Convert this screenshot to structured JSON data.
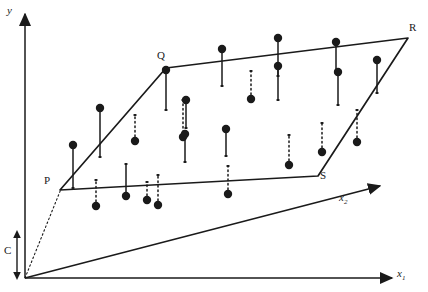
{
  "figure": {
    "background": "#ffffff",
    "ink": "#1a1a1a",
    "width": 428,
    "height": 292
  },
  "axes": {
    "y": {
      "label": "y",
      "label_x": 8,
      "label_y": 10,
      "from": [
        25,
        278
      ],
      "to": [
        25,
        14
      ],
      "arrow": true
    },
    "x1": {
      "label": "x",
      "sub": "1",
      "label_x": 398,
      "label_y": 274,
      "from": [
        25,
        278
      ],
      "to": [
        392,
        278
      ],
      "arrow": true
    },
    "x2": {
      "label": "x",
      "sub": "2",
      "label_x": 340,
      "label_y": 196,
      "from": [
        25,
        278
      ],
      "to": [
        380,
        186
      ],
      "arrow": true
    }
  },
  "intercept": {
    "label": "C",
    "label_x": 5,
    "label_y": 247,
    "arrow_x": 17,
    "arrow_top": 232,
    "arrow_bottom": 278,
    "guide_from": [
      25,
      278
    ],
    "guide_to": [
      60,
      190
    ],
    "style": "dotted double-headed arrow"
  },
  "plane": {
    "name": "regression-plane",
    "vertices": [
      {
        "label": "P",
        "x": 60,
        "y": 190,
        "label_x": 44,
        "label_y": 182
      },
      {
        "label": "Q",
        "x": 166,
        "y": 68,
        "label_x": 158,
        "label_y": 53
      },
      {
        "label": "R",
        "x": 408,
        "y": 38,
        "label_x": 409,
        "label_y": 25
      },
      {
        "label": "S",
        "x": 318,
        "y": 176,
        "label_x": 320,
        "label_y": 176
      }
    ],
    "stroke_width": 1.6
  },
  "chart_data": {
    "type": "scatter",
    "xlabel": "x1",
    "ylabel": "y",
    "zlabel": "x2",
    "grid": false,
    "legend": null,
    "marker_radius": 4.2,
    "points": [
      {
        "id": 1,
        "dot_x": 100,
        "dot_y": 108,
        "foot_x": 100,
        "foot_y": 157,
        "residual": "positive",
        "stem": "solid"
      },
      {
        "id": 2,
        "dot_x": 73,
        "dot_y": 145,
        "foot_x": 73,
        "foot_y": 188,
        "residual": "positive",
        "stem": "solid"
      },
      {
        "id": 3,
        "dot_x": 135,
        "dot_y": 141,
        "foot_x": 135,
        "foot_y": 115,
        "residual": "negative",
        "stem": "dotted"
      },
      {
        "id": 4,
        "dot_x": 126,
        "dot_y": 196,
        "foot_x": 126,
        "foot_y": 164,
        "residual": "positive",
        "stem": "solid"
      },
      {
        "id": 5,
        "dot_x": 166,
        "dot_y": 70,
        "foot_x": 166,
        "foot_y": 110,
        "residual": "positive",
        "stem": "solid"
      },
      {
        "id": 6,
        "dot_x": 158,
        "dot_y": 205,
        "foot_x": 158,
        "foot_y": 175,
        "residual": "negative",
        "stem": "dotted"
      },
      {
        "id": 7,
        "dot_x": 183,
        "dot_y": 137,
        "foot_x": 183,
        "foot_y": 100,
        "residual": "negative",
        "stem": "dotted"
      },
      {
        "id": 8,
        "dot_x": 186,
        "dot_y": 100,
        "foot_x": 186,
        "foot_y": 128,
        "residual": "positive",
        "stem": "solid"
      },
      {
        "id": 9,
        "dot_x": 185,
        "dot_y": 134,
        "foot_x": 185,
        "foot_y": 162,
        "residual": "positive",
        "stem": "solid"
      },
      {
        "id": 10,
        "dot_x": 222,
        "dot_y": 49,
        "foot_x": 222,
        "foot_y": 86,
        "residual": "positive",
        "stem": "solid"
      },
      {
        "id": 11,
        "dot_x": 251,
        "dot_y": 99,
        "foot_x": 251,
        "foot_y": 71,
        "residual": "negative",
        "stem": "dotted"
      },
      {
        "id": 12,
        "dot_x": 226,
        "dot_y": 129,
        "foot_x": 226,
        "foot_y": 156,
        "residual": "positive",
        "stem": "solid"
      },
      {
        "id": 13,
        "dot_x": 228,
        "dot_y": 194,
        "foot_x": 228,
        "foot_y": 166,
        "residual": "negative",
        "stem": "dotted"
      },
      {
        "id": 14,
        "dot_x": 278,
        "dot_y": 66,
        "foot_x": 278,
        "foot_y": 100,
        "residual": "positive",
        "stem": "solid"
      },
      {
        "id": 15,
        "dot_x": 278,
        "dot_y": 38,
        "foot_x": 278,
        "foot_y": 76,
        "residual": "positive",
        "stem": "solid"
      },
      {
        "id": 16,
        "dot_x": 289,
        "dot_y": 165,
        "foot_x": 289,
        "foot_y": 135,
        "residual": "negative",
        "stem": "dotted"
      },
      {
        "id": 17,
        "dot_x": 336,
        "dot_y": 42,
        "foot_x": 336,
        "foot_y": 73,
        "residual": "positive",
        "stem": "solid"
      },
      {
        "id": 18,
        "dot_x": 338,
        "dot_y": 72,
        "foot_x": 338,
        "foot_y": 105,
        "residual": "positive",
        "stem": "solid"
      },
      {
        "id": 19,
        "dot_x": 322,
        "dot_y": 152,
        "foot_x": 322,
        "foot_y": 123,
        "residual": "negative",
        "stem": "dotted"
      },
      {
        "id": 20,
        "dot_x": 377,
        "dot_y": 60,
        "foot_x": 377,
        "foot_y": 93,
        "residual": "positive",
        "stem": "solid"
      },
      {
        "id": 21,
        "dot_x": 357,
        "dot_y": 142,
        "foot_x": 357,
        "foot_y": 110,
        "residual": "negative",
        "stem": "dotted"
      },
      {
        "id": 22,
        "dot_x": 96,
        "dot_y": 206,
        "foot_x": 96,
        "foot_y": 180,
        "residual": "negative",
        "stem": "dotted"
      },
      {
        "id": 23,
        "dot_x": 147,
        "dot_y": 200,
        "foot_x": 147,
        "foot_y": 182,
        "residual": "negative",
        "stem": "dotted"
      }
    ]
  }
}
